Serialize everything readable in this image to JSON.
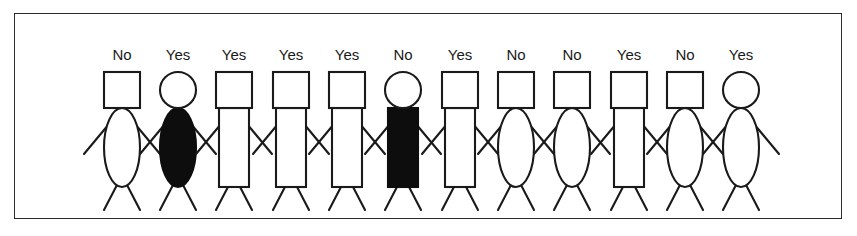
{
  "panel": {
    "border_color": "#2b2b2b",
    "background_color": "#ffffff",
    "ink_color": "#1a1a1a",
    "fill_black": "#0d0d0d",
    "fill_white": "#ffffff"
  },
  "chart_data": {
    "type": "diagram",
    "title": "",
    "categories": [
      "figure-1",
      "figure-2",
      "figure-3",
      "figure-4",
      "figure-5",
      "figure-6",
      "figure-7",
      "figure-8",
      "figure-9",
      "figure-10",
      "figure-11",
      "figure-12"
    ],
    "labels": [
      "No",
      "Yes",
      "Yes",
      "Yes",
      "Yes",
      "No",
      "Yes",
      "No",
      "No",
      "Yes",
      "No",
      "Yes"
    ],
    "counts": {
      "Yes": 7,
      "No": 5,
      "total": 12
    },
    "legend": [
      "Yes",
      "No"
    ]
  },
  "figures": [
    {
      "index": 1,
      "label": "No",
      "head": "square",
      "body": "oval",
      "fill": "white",
      "cx": 121
    },
    {
      "index": 2,
      "label": "Yes",
      "head": "round",
      "body": "oval",
      "fill": "black",
      "cx": 177
    },
    {
      "index": 3,
      "label": "Yes",
      "head": "square",
      "body": "rect",
      "fill": "white",
      "cx": 233
    },
    {
      "index": 4,
      "label": "Yes",
      "head": "square",
      "body": "rect",
      "fill": "white",
      "cx": 290
    },
    {
      "index": 5,
      "label": "Yes",
      "head": "square",
      "body": "rect",
      "fill": "white",
      "cx": 346
    },
    {
      "index": 6,
      "label": "No",
      "head": "round",
      "body": "rect",
      "fill": "black",
      "cx": 402
    },
    {
      "index": 7,
      "label": "Yes",
      "head": "square",
      "body": "rect",
      "fill": "white",
      "cx": 459
    },
    {
      "index": 8,
      "label": "No",
      "head": "square",
      "body": "oval",
      "fill": "white",
      "cx": 515
    },
    {
      "index": 9,
      "label": "No",
      "head": "square",
      "body": "oval",
      "fill": "white",
      "cx": 571
    },
    {
      "index": 10,
      "label": "Yes",
      "head": "square",
      "body": "rect",
      "fill": "white",
      "cx": 628
    },
    {
      "index": 11,
      "label": "No",
      "head": "square",
      "body": "oval",
      "fill": "white",
      "cx": 684
    },
    {
      "index": 12,
      "label": "Yes",
      "head": "round",
      "body": "oval",
      "fill": "white",
      "cx": 740
    }
  ],
  "geometry": {
    "label_y": 46,
    "head_top": 58,
    "head_size": 36,
    "head_bottom": 94,
    "body_top": 94,
    "body_bottom": 173,
    "body_rect_width": 30,
    "body_oval_rx": 18,
    "shoulder_y": 104,
    "arm_end_y": 140,
    "leg_end_y": 196,
    "hip_y": 173
  }
}
